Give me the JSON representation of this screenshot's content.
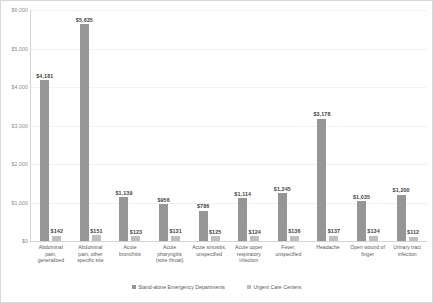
{
  "chart_data": {
    "type": "bar",
    "title": "",
    "subtitle": "",
    "xlabel": "",
    "ylabel": "",
    "ylim": [
      0,
      6000
    ],
    "ytick_step": 1000,
    "grid": true,
    "legend_position": "bottom",
    "ticks": [
      "$0",
      "$1,000",
      "$2,000",
      "$3,000",
      "$4,000",
      "$5,000",
      "$6,000"
    ],
    "categories": [
      "Abdominal pain, generalized",
      "Abdominal pain, other specific site",
      "Acute bronchitis",
      "Acute pharyngitis (sore throat)",
      "Acute sinusitis, unspecified",
      "Acute upper respiratory infection",
      "Fever, unspecified",
      "Headache",
      "Open wound of finger",
      "Urinary tract infection"
    ],
    "category_lines": [
      [
        "Abdominal",
        "pain,",
        "generalized"
      ],
      [
        "Abdominal",
        "pain, other",
        "specific site"
      ],
      [
        "Acute",
        "bronchitis"
      ],
      [
        "Acute",
        "pharyngitis",
        "(sore throat)"
      ],
      [
        "Acute sinusitis,",
        "unspecified"
      ],
      [
        "Acute upper",
        "respiratory",
        "infection"
      ],
      [
        "Fever,",
        "unspecified"
      ],
      [
        "Headache"
      ],
      [
        "Open wound of",
        "finger"
      ],
      [
        "Urinary tract",
        "infection"
      ]
    ],
    "series": [
      {
        "name": "Stand-alone Emergency Departments",
        "color": "#969696",
        "values": [
          4181,
          5635,
          1139,
          956,
          786,
          1114,
          1245,
          3178,
          1035,
          1200
        ],
        "labels": [
          "$4,181",
          "$5,635",
          "$1,139",
          "$956",
          "$786",
          "$1,114",
          "$1,245",
          "$3,178",
          "$1,035",
          "$1,200"
        ]
      },
      {
        "name": "Urgent Care Centers",
        "color": "#bfbfbf",
        "values": [
          142,
          151,
          123,
          131,
          125,
          124,
          136,
          137,
          134,
          112
        ],
        "labels": [
          "$142",
          "$151",
          "$123",
          "$131",
          "$125",
          "$124",
          "$136",
          "$137",
          "$134",
          "$112"
        ]
      }
    ]
  },
  "legend": {
    "items": [
      {
        "label": "Stand-alone Emergency Departments"
      },
      {
        "label": "Urgent Care Centers"
      }
    ]
  }
}
